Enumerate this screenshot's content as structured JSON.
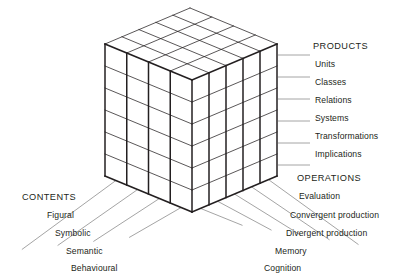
{
  "diagram": {
    "line_color": "#231f20",
    "leader_color": "#8d8d8d",
    "face_color": "#ffffff"
  },
  "axes": {
    "products": {
      "header": "PRODUCTS",
      "items": [
        {
          "label": "Units"
        },
        {
          "label": "Classes"
        },
        {
          "label": "Relations"
        },
        {
          "label": "Systems"
        },
        {
          "label": "Transformations"
        },
        {
          "label": "Implications"
        }
      ]
    },
    "operations": {
      "header": "OPERATIONS",
      "items": [
        {
          "label": "Evaluation"
        },
        {
          "label": "Convergent production"
        },
        {
          "label": "Divergent production"
        },
        {
          "label": "Memory"
        },
        {
          "label": "Cognition"
        }
      ]
    },
    "contents": {
      "header": "CONTENTS",
      "items": [
        {
          "label": "Figural"
        },
        {
          "label": "Symbolic"
        },
        {
          "label": "Semantic"
        },
        {
          "label": "Behavioural"
        }
      ]
    }
  }
}
